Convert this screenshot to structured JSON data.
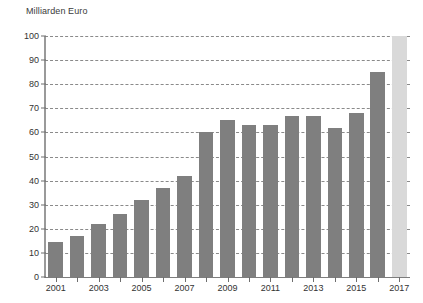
{
  "chart_data": {
    "type": "bar",
    "title": "Milliarden Euro",
    "xlabel": "",
    "ylabel": "Milliarden Euro",
    "ylim": [
      0,
      100
    ],
    "ytick_step": 10,
    "yticks": [
      0,
      10,
      20,
      30,
      40,
      50,
      60,
      70,
      80,
      90,
      100
    ],
    "grid": true,
    "legend": "none",
    "categories": [
      "2001",
      "2002",
      "2003",
      "2004",
      "2005",
      "2006",
      "2007",
      "2008",
      "2009",
      "2010",
      "2011",
      "2012",
      "2013",
      "2014",
      "2015",
      "2016",
      "2017"
    ],
    "xtick_labels_shown": [
      "2001",
      "2003",
      "2005",
      "2007",
      "2009",
      "2011",
      "2013",
      "2015",
      "2017"
    ],
    "values": [
      14.5,
      17,
      22,
      26,
      32,
      37,
      42,
      60,
      65,
      63,
      63,
      67,
      67,
      62,
      68,
      85,
      100
    ],
    "bar_styles": [
      "actual",
      "actual",
      "actual",
      "actual",
      "actual",
      "actual",
      "actual",
      "actual",
      "actual",
      "actual",
      "actual",
      "actual",
      "actual",
      "actual",
      "actual",
      "actual",
      "forecast"
    ],
    "colors": {
      "bar_actual": "#7f7f7f",
      "bar_forecast": "#d9d9d9",
      "grid": "#8a8a8a",
      "axis": "#9a9a9a",
      "text": "#333333",
      "background": "#ffffff"
    }
  }
}
